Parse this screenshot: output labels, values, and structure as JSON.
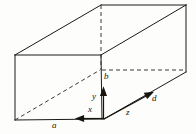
{
  "figure": {
    "type": "line-diagram",
    "canvas": {
      "width": 196,
      "height": 134,
      "background": "#fdfdfc"
    },
    "stroke": {
      "solid_color": "#1b1a16",
      "dashed_color": "#3a3934",
      "width": 1.0,
      "dash_pattern": "4 3"
    },
    "labels": {
      "edge_a": "a",
      "edge_b": "b",
      "edge_d": "d",
      "axis_x": "x",
      "axis_y": "y",
      "axis_z": "z"
    },
    "label_positions": {
      "edge_a": {
        "x": 52,
        "y": 121
      },
      "edge_b": {
        "x": 104,
        "y": 72
      },
      "edge_d": {
        "x": 152,
        "y": 94
      },
      "axis_x": {
        "x": 88,
        "y": 105
      },
      "axis_y": {
        "x": 92,
        "y": 92
      },
      "axis_z": {
        "x": 126,
        "y": 108
      }
    },
    "geometry": {
      "origin": {
        "x": 104,
        "y": 119
      },
      "front_face_bottom_left": {
        "x": 15,
        "y": 120
      },
      "front_face_top_left": {
        "x": 15,
        "y": 55
      },
      "front_face_top_right": {
        "x": 101,
        "y": 55
      },
      "back_top_left": {
        "x": 101,
        "y": 5
      },
      "back_top_right": {
        "x": 186,
        "y": 5
      },
      "right_bottom": {
        "x": 186,
        "y": 72
      },
      "hidden_vertical": {
        "x": 101,
        "y1": 5,
        "y2": 70
      },
      "hidden_horizontal": {
        "x1": 102,
        "y": 70,
        "x2": 186
      },
      "hidden_diagonal": {
        "x1": 15,
        "y1": 120,
        "x2": 101,
        "y2": 70
      }
    },
    "axes": {
      "x_axis": {
        "from": {
          "x": 104,
          "y": 119
        },
        "to": {
          "x": 76,
          "y": 119
        },
        "arrow": "left"
      },
      "y_axis": {
        "from": {
          "x": 104,
          "y": 119
        },
        "to": {
          "x": 104,
          "y": 90
        },
        "arrow": "up"
      },
      "z_axis": {
        "from": {
          "x": 104,
          "y": 119
        },
        "to": {
          "x": 152,
          "y": 93
        },
        "arrow": "up-right"
      }
    }
  }
}
